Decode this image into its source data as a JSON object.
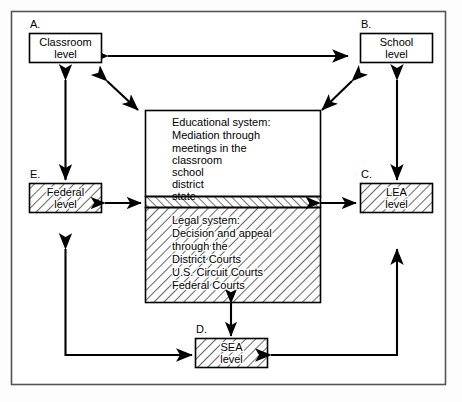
{
  "diagram": {
    "frame": {
      "stroke": "#555555",
      "fill": "#ffffff"
    },
    "colors": {
      "line": "#000000",
      "box_fill": "#ffffff",
      "hatch_stroke": "#000000",
      "frame": "#555555"
    },
    "nodes": [
      {
        "id": "A",
        "caption": "A.",
        "line1": "Classroom",
        "line2": "level",
        "hatched": false
      },
      {
        "id": "B",
        "caption": "B.",
        "line1": "School",
        "line2": "level",
        "hatched": false
      },
      {
        "id": "C",
        "caption": "C.",
        "line1": "LEA",
        "line2": "level",
        "hatched": true
      },
      {
        "id": "D",
        "caption": "D.",
        "line1": "SEA",
        "line2": "level",
        "hatched": true
      },
      {
        "id": "E",
        "caption": "E.",
        "line1": "Federal",
        "line2": "level",
        "hatched": true
      }
    ],
    "center": {
      "educational": {
        "heading": "Educational system:",
        "lines": [
          "Mediation through",
          "meetings in the",
          "classroom",
          "school",
          "district",
          "state"
        ]
      },
      "legal": {
        "heading": "Legal system:",
        "lines": [
          "Decision and appeal",
          "through the",
          "District Courts",
          "U.S. Circuit Courts",
          "Federal Courts"
        ]
      }
    },
    "connectors": [
      {
        "name": "classroom-school",
        "style": "double-headed-horizontal"
      },
      {
        "name": "classroom-center",
        "style": "double-headed-diagonal"
      },
      {
        "name": "school-center",
        "style": "double-headed-diagonal"
      },
      {
        "name": "classroom-federal",
        "style": "double-headed-vertical"
      },
      {
        "name": "school-lea",
        "style": "double-headed-vertical"
      },
      {
        "name": "federal-center",
        "style": "double-headed-horizontal"
      },
      {
        "name": "center-lea",
        "style": "double-headed-horizontal"
      },
      {
        "name": "center-sea",
        "style": "double-headed-vertical"
      },
      {
        "name": "sea-federal",
        "style": "elbow-double-headed"
      },
      {
        "name": "sea-lea",
        "style": "elbow-double-headed"
      }
    ]
  }
}
